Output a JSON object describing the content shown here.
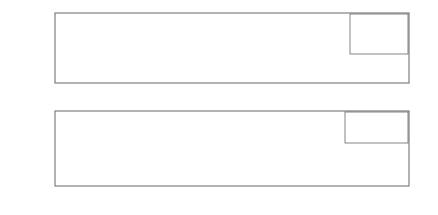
{
  "chart_data": [
    {
      "type": "line",
      "title": "",
      "xlabel": "X[m]",
      "ylabel": "-w_e (m)",
      "xlim": [
        -0.2,
        0.25
      ],
      "ylim": [
        -0.022,
        0.001
      ],
      "xticks": [
        -0.2,
        -0.15,
        -0.1,
        -0.05,
        0,
        0.05,
        0.1,
        0.15,
        0.2,
        0.25
      ],
      "xtick_labels": [
        "-0.2",
        "-0.15",
        "-0.1",
        "-0.05",
        "0",
        "0.05",
        "0.1",
        "0.15",
        "0.2",
        "0.25"
      ],
      "yticks": [
        0,
        -0.005,
        -0.01,
        -0.015,
        -0.02
      ],
      "ytick_labels": [
        "0",
        "-0.005",
        "-0.01",
        "-0.015",
        "-0.02"
      ],
      "grid": true,
      "legend_position": "upper right",
      "series": [
        {
          "name": "Road profile",
          "style": "solid-thick",
          "x": [
            -0.2,
            -0.1,
            -0.1,
            0.1,
            0.1,
            0.25
          ],
          "y": [
            0,
            0,
            -0.02,
            -0.02,
            0,
            0
          ]
        },
        {
          "name": "F_z = 2000 N",
          "style": "solid",
          "x": [
            -0.2,
            -0.15,
            -0.12,
            -0.1,
            -0.08,
            -0.06,
            -0.045,
            -0.035,
            -0.028,
            -0.015,
            0,
            0.015,
            0.028,
            0.035,
            0.045,
            0.06,
            0.08,
            0.1,
            0.12,
            0.15,
            0.25
          ],
          "y": [
            0,
            0,
            -0.0003,
            -0.0012,
            -0.0032,
            -0.0065,
            -0.0093,
            -0.0112,
            -0.0125,
            -0.0118,
            -0.0115,
            -0.0118,
            -0.0125,
            -0.0112,
            -0.0093,
            -0.0065,
            -0.0032,
            -0.0012,
            -0.0003,
            0,
            0
          ]
        },
        {
          "name": "F_z = 4000 N",
          "style": "dashed",
          "x": [
            -0.2,
            -0.15,
            -0.12,
            -0.1,
            -0.08,
            -0.065,
            -0.05,
            -0.04,
            -0.02,
            0,
            0.02,
            0.04,
            0.05,
            0.065,
            0.08,
            0.1,
            0.12,
            0.15,
            0.25
          ],
          "y": [
            0,
            0,
            -0.0006,
            -0.002,
            -0.0048,
            -0.0078,
            -0.0102,
            -0.0095,
            -0.0078,
            -0.0073,
            -0.0078,
            -0.0095,
            -0.0102,
            -0.0078,
            -0.0048,
            -0.002,
            -0.0006,
            0,
            0
          ]
        },
        {
          "name": "F_z = 6000 N",
          "style": "dash-dot",
          "x": [
            -0.2,
            -0.15,
            -0.12,
            -0.1,
            -0.08,
            -0.06,
            -0.05,
            -0.03,
            0,
            0.03,
            0.05,
            0.06,
            0.08,
            0.1,
            0.12,
            0.15,
            0.25
          ],
          "y": [
            0,
            0,
            -0.001,
            -0.0028,
            -0.0062,
            -0.0102,
            -0.0088,
            -0.0058,
            -0.0045,
            -0.0058,
            -0.0088,
            -0.0102,
            -0.0062,
            -0.0028,
            -0.001,
            0,
            0
          ]
        }
      ]
    },
    {
      "type": "line",
      "title": "",
      "xlabel": "X[m]",
      "ylabel": "Slope β_e",
      "xlim": [
        -0.2,
        0.25
      ],
      "ylim": [
        -0.28,
        0.28
      ],
      "xticks": [
        -0.2,
        -0.15,
        -0.1,
        -0.05,
        0,
        0.05,
        0.1,
        0.15,
        0.2,
        0.25
      ],
      "xtick_labels": [
        "-0.2",
        "-0.15",
        "-0.1",
        "-0.05",
        "0",
        "0.05",
        "0.1",
        "0.15",
        "0.2",
        "0.25"
      ],
      "yticks": [
        0.2,
        0.1,
        0,
        -0.1,
        -0.2
      ],
      "ytick_labels": [
        "0.2",
        "0.1",
        "0",
        "-0.1",
        "-0.2"
      ],
      "grid": true,
      "legend_position": "upper right",
      "series": [
        {
          "name": "F_z = 2000 N",
          "style": "solid",
          "x": [
            -0.2,
            -0.15,
            -0.12,
            -0.1,
            -0.08,
            -0.06,
            -0.045,
            -0.037,
            -0.03,
            0,
            0.03,
            0.037,
            0.045,
            0.06,
            0.08,
            0.1,
            0.12,
            0.15,
            0.25
          ],
          "y": [
            0,
            0,
            -0.01,
            -0.04,
            -0.09,
            -0.16,
            -0.22,
            -0.25,
            -0.23,
            0,
            0.23,
            0.25,
            0.22,
            0.16,
            0.09,
            0.04,
            0.01,
            0,
            0
          ]
        },
        {
          "name": "F_z = 4000 N",
          "style": "dashed",
          "x": [
            -0.2,
            -0.15,
            -0.12,
            -0.1,
            -0.08,
            -0.065,
            -0.05,
            0,
            0.05,
            0.065,
            0.08,
            0.1,
            0.12,
            0.15,
            0.25
          ],
          "y": [
            0,
            0,
            -0.02,
            -0.05,
            -0.1,
            -0.15,
            -0.19,
            0,
            0.19,
            0.15,
            0.1,
            0.05,
            0.02,
            0,
            0
          ]
        },
        {
          "name": "F_z = 6000 N",
          "style": "dash-dot",
          "x": [
            -0.2,
            -0.15,
            -0.12,
            -0.1,
            -0.085,
            -0.065,
            0,
            0.065,
            0.085,
            0.1,
            0.12,
            0.15,
            0.25
          ],
          "y": [
            0,
            0,
            -0.03,
            -0.07,
            -0.11,
            -0.15,
            0,
            0.15,
            0.11,
            0.07,
            0.03,
            0,
            0
          ]
        }
      ]
    }
  ],
  "top_chart": {
    "ylabel_main": "-w",
    "ylabel_sub": "e",
    "ylabel_unit": " (m)",
    "xlabel": "X[m]",
    "legend": [
      "Road profile",
      "F",
      "F",
      "F"
    ],
    "legend_entries": [
      {
        "label": "Road profile"
      },
      {
        "pre": "F",
        "sub": "z",
        "post": " = 2000 N"
      },
      {
        "pre": "F",
        "sub": "z",
        "post": " = 4000 N"
      },
      {
        "pre": "F",
        "sub": "z",
        "post": " = 6000 N"
      }
    ]
  },
  "bottom_chart": {
    "ylabel_main": "Slope β",
    "ylabel_sub": "e",
    "xlabel": "X[m]",
    "legend_entries": [
      {
        "pre": "F",
        "sub": "z",
        "post": " = 2000 N"
      },
      {
        "pre": "F",
        "sub": "z",
        "post": " = 4000 N"
      },
      {
        "pre": "F",
        "sub": "z",
        "post": " = 6000 N"
      }
    ]
  },
  "colors": {
    "line": "#333333",
    "road": "#555555",
    "axis": "#666666",
    "grid": "#bbbbbb",
    "text": "#333333"
  }
}
